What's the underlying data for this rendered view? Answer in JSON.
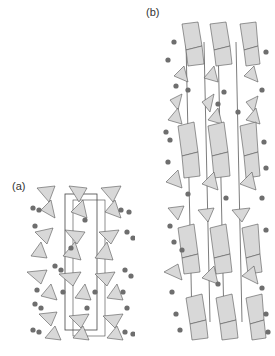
{
  "figure": {
    "panels": [
      {
        "id": "a",
        "label": "(a)",
        "description": "Crystal structure unit cell with tetrahedra and spheres (smaller cell)"
      },
      {
        "id": "b",
        "label": "(b)",
        "description": "Crystal structure with octahedral layers, tetrahedra and spheres (elongated cell)"
      }
    ]
  },
  "colors": {
    "polyhedron_fill": "#d8d8d8",
    "polyhedron_edge": "#555555",
    "atom": "#6e6e6e",
    "cell_line": "#444444"
  }
}
